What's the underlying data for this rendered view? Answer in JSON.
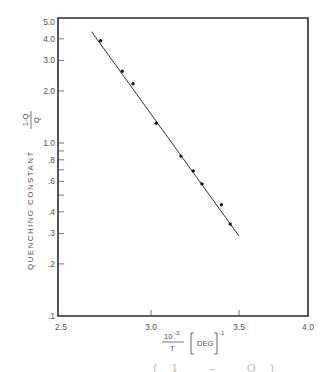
{
  "chart_data": {
    "type": "scatter",
    "title": "",
    "xlabel": "10^-3 / T [DEG]^-1",
    "ylabel": "QUENCHING CONSTANT (1-Q)/Q",
    "xscale": "linear",
    "yscale": "log",
    "xlim": [
      2.5,
      4.0
    ],
    "ylim": [
      0.1,
      5.0
    ],
    "x_ticks": [
      "2.5",
      "3.0",
      "3.5",
      "4.0"
    ],
    "y_ticks": [
      "5.0",
      "4.0",
      "3.0",
      "2.0",
      "1.0",
      ".8",
      ".6",
      ".4",
      ".3",
      ".2",
      ".1"
    ],
    "grid": false,
    "legend": null,
    "series": [
      {
        "name": "measured",
        "style": "points",
        "x": [
          2.72,
          2.84,
          2.9,
          3.03,
          3.17,
          3.24,
          3.29,
          3.4,
          3.45
        ],
        "y": [
          3.9,
          2.6,
          2.2,
          1.3,
          0.84,
          0.69,
          0.58,
          0.44,
          0.34
        ]
      },
      {
        "name": "fit",
        "style": "line",
        "x": [
          2.67,
          3.5
        ],
        "y": [
          4.4,
          0.29
        ]
      }
    ]
  },
  "axes": {
    "y_title_main": "QUENCHING CONSTANT",
    "y_title_num": "1-Q",
    "y_title_den": "Q",
    "x_title_num": "10",
    "x_title_exp": "-3",
    "x_title_den": "T",
    "x_title_unit": "DEG",
    "x_title_unit_exp": "-1"
  },
  "caption_fragment": "(1 – Q)"
}
